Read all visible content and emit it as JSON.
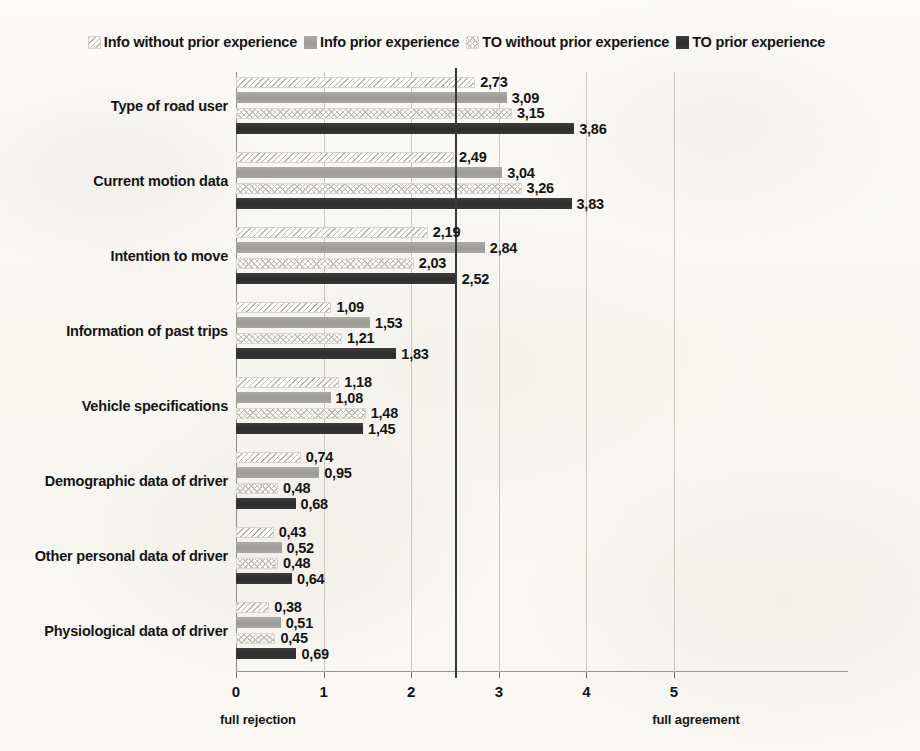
{
  "chart_data": {
    "type": "bar",
    "orientation": "horizontal",
    "title": "",
    "xlabel": "",
    "ylabel": "",
    "xlim": [
      0,
      5.4
    ],
    "grid": true,
    "grid_axis": "x",
    "legend_position": "top-center",
    "xticks": [
      "0",
      "1",
      "2",
      "3",
      "4",
      "5"
    ],
    "xtick_values": [
      0,
      1,
      2,
      3,
      4,
      5
    ],
    "axis_endpoint_labels": {
      "left": "full rejection",
      "right": "full agreement"
    },
    "reference_line": {
      "value": 2.5,
      "style": "solid-dark"
    },
    "decimal_separator": ",",
    "categories": [
      "Type of road user",
      "Current motion data",
      "Intention to move",
      "Information of past trips",
      "Vehicle specifications",
      "Demographic data of driver",
      "Other personal data of driver",
      "Physiological data of driver"
    ],
    "series": [
      {
        "name": "Info without prior experience",
        "pattern": "diagonal-hatch-light",
        "color": "#b9b6b0",
        "values": [
          2.73,
          2.49,
          2.19,
          1.09,
          1.18,
          0.74,
          0.43,
          0.38
        ],
        "labels": [
          "2,73",
          "2,49",
          "2,19",
          "1,09",
          "1,18",
          "0,74",
          "0,43",
          "0,38"
        ]
      },
      {
        "name": "Info prior experience",
        "pattern": "solid-gray",
        "color": "#a3a19c",
        "values": [
          3.09,
          3.04,
          2.84,
          1.53,
          1.08,
          0.95,
          0.52,
          0.51
        ],
        "labels": [
          "3,09",
          "3,04",
          "2,84",
          "1,53",
          "1,08",
          "0,95",
          "0,52",
          "0,51"
        ]
      },
      {
        "name": "TO without prior experience",
        "pattern": "crosshatch-light",
        "color": "#c3c0ba",
        "values": [
          3.15,
          3.26,
          2.03,
          1.21,
          1.48,
          0.48,
          0.48,
          0.45
        ],
        "labels": [
          "3,15",
          "3,26",
          "2,03",
          "1,21",
          "1,48",
          "0,48",
          "0,48",
          "0,45"
        ]
      },
      {
        "name": "TO prior experience",
        "pattern": "solid-dark",
        "color": "#343434",
        "values": [
          3.86,
          3.83,
          2.52,
          1.83,
          1.45,
          0.68,
          0.64,
          0.69
        ],
        "labels": [
          "3,86",
          "3,83",
          "2,52",
          "1,83",
          "1,45",
          "0,68",
          "0,64",
          "0,69"
        ]
      }
    ]
  }
}
